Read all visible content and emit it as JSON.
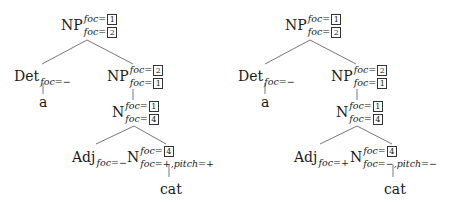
{
  "trees": [
    {
      "root": {
        "label": "NP",
        "sup": "foc=",
        "sup_box": "1",
        "sub": "foc=",
        "sub_box": "2"
      },
      "det": {
        "label": "Det",
        "sub": "foc=−"
      },
      "det_word": "a",
      "np2": {
        "label": "NP",
        "sup": "foc=",
        "sup_box": "2",
        "sub": "foc=",
        "sub_box": "1"
      },
      "n1": {
        "label": "N",
        "sup": "foc=",
        "sup_box": "1",
        "sub": "foc=",
        "sub_box": "4"
      },
      "adj": {
        "label": "Adj",
        "sub": "foc=−"
      },
      "n2": {
        "label": "N",
        "sup": "foc=",
        "sup_box": "4",
        "sub": "foc=+,pitch=+"
      },
      "n2_word": "cat"
    },
    {
      "root": {
        "label": "NP",
        "sup": "foc=",
        "sup_box": "1",
        "sub": "foc=",
        "sub_box": "2"
      },
      "det": {
        "label": "Det",
        "sub": "foc=−"
      },
      "det_word": "a",
      "np2": {
        "label": "NP",
        "sup": "foc=",
        "sup_box": "2",
        "sub": "foc=",
        "sub_box": "1"
      },
      "n1": {
        "label": "N",
        "sup": "foc=",
        "sup_box": "1",
        "sub": "foc=",
        "sub_box": "4"
      },
      "adj": {
        "label": "Adj",
        "sub": "foc=+"
      },
      "n2": {
        "label": "N",
        "sup": "foc=",
        "sup_box": "4",
        "sub": "foc=−,pitch=−"
      },
      "n2_word": "cat"
    }
  ]
}
